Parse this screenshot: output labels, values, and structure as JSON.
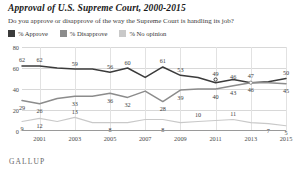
{
  "header": {
    "title": "Approval of U.S. Supreme Court, 2000-2015",
    "subtitle": "Do you approve or disapprove of the way the Supreme Court is handling its job?",
    "brand": "GALLUP"
  },
  "colors": {
    "approve": "#3b3b3b",
    "disapprove": "#8c8c8c",
    "no_opinion": "#c9c9c9",
    "grid": "#d8d8d8",
    "axis": "#9a9a9a",
    "text": "#3d3d3d"
  },
  "chart_data": {
    "type": "line",
    "title": "Approval of U.S. Supreme Court, 2000-2015",
    "subtitle": "Do you approve or disapprove of the way the Supreme Court is handling its job?",
    "xlabel": "",
    "ylabel": "",
    "ylim": [
      0,
      80
    ],
    "yticks": [
      0,
      20,
      40,
      60,
      80
    ],
    "ytick_labels": [
      "0",
      "20",
      "40",
      "60",
      "80"
    ],
    "grid": true,
    "legend_position": "top-left",
    "x": [
      2000,
      2001,
      2002,
      2003,
      2004,
      2005,
      2006,
      2007,
      2008,
      2009,
      2010,
      2011,
      2012,
      2013,
      2014,
      2015
    ],
    "xticks": [
      2001,
      2003,
      2005,
      2007,
      2009,
      2011,
      2013,
      2015
    ],
    "xtick_labels": [
      "2001",
      "2003",
      "2005",
      "2007",
      "2009",
      "2011",
      "2013",
      "2015"
    ],
    "series": [
      {
        "name": "% Approve",
        "color": "#3b3b3b",
        "values": [
          62,
          62,
          60,
          59,
          59,
          56,
          60,
          51,
          61,
          53,
          51,
          46,
          49,
          46,
          47,
          50
        ],
        "labels": [
          {
            "x": 2000,
            "y": 62,
            "text": "62",
            "pos": "above"
          },
          {
            "x": 2001,
            "y": 62,
            "text": "62",
            "pos": "above"
          },
          {
            "x": 2003,
            "y": 59,
            "text": "59",
            "pos": "above"
          },
          {
            "x": 2005,
            "y": 56,
            "text": "56",
            "pos": "above"
          },
          {
            "x": 2006,
            "y": 60,
            "text": "60",
            "pos": "above"
          },
          {
            "x": 2008,
            "y": 61,
            "text": "61",
            "pos": "above"
          },
          {
            "x": 2009,
            "y": 53,
            "text": "53",
            "pos": "above"
          },
          {
            "x": 2011,
            "y": 49,
            "text": "49",
            "pos": "above"
          },
          {
            "x": 2012,
            "y": 46,
            "text": "46",
            "pos": "above"
          },
          {
            "x": 2013,
            "y": 47,
            "text": "47",
            "pos": "above"
          },
          {
            "x": 2015,
            "y": 50,
            "text": "50",
            "pos": "above"
          }
        ]
      },
      {
        "name": "% Disapprove",
        "color": "#8c8c8c",
        "values": [
          29,
          26,
          31,
          33,
          33,
          36,
          32,
          38,
          28,
          39,
          40,
          40,
          43,
          46,
          46,
          45
        ],
        "labels": [
          {
            "x": 2000,
            "y": 29,
            "text": "29",
            "pos": "below"
          },
          {
            "x": 2001,
            "y": 26,
            "text": "26",
            "pos": "below"
          },
          {
            "x": 2003,
            "y": 33,
            "text": "33",
            "pos": "below"
          },
          {
            "x": 2005,
            "y": 36,
            "text": "36",
            "pos": "below"
          },
          {
            "x": 2006,
            "y": 32,
            "text": "32",
            "pos": "below"
          },
          {
            "x": 2008,
            "y": 28,
            "text": "28",
            "pos": "below"
          },
          {
            "x": 2009,
            "y": 39,
            "text": "39",
            "pos": "below"
          },
          {
            "x": 2011,
            "y": 40,
            "text": "40",
            "pos": "below"
          },
          {
            "x": 2012,
            "y": 43,
            "text": "43",
            "pos": "below"
          },
          {
            "x": 2013,
            "y": 46,
            "text": "46",
            "pos": "below"
          },
          {
            "x": 2015,
            "y": 45,
            "text": "45",
            "pos": "below"
          }
        ]
      },
      {
        "name": "% No opinion",
        "color": "#c9c9c9",
        "values": [
          9,
          12,
          9,
          13,
          8,
          8,
          8,
          11,
          11,
          8,
          9,
          10,
          11,
          8,
          7,
          5
        ],
        "labels": [
          {
            "x": 2000,
            "y": 9,
            "text": "9",
            "pos": "below"
          },
          {
            "x": 2001,
            "y": 12,
            "text": "12",
            "pos": "below"
          },
          {
            "x": 2003,
            "y": 13,
            "text": "13",
            "pos": "above"
          },
          {
            "x": 2005,
            "y": 8,
            "text": "8",
            "pos": "below"
          },
          {
            "x": 2008,
            "y": 8,
            "text": "8",
            "pos": "below"
          },
          {
            "x": 2010,
            "y": 10,
            "text": "10",
            "pos": "above"
          },
          {
            "x": 2012,
            "y": 11,
            "text": "11",
            "pos": "above"
          },
          {
            "x": 2014,
            "y": 7,
            "text": "7",
            "pos": "below"
          },
          {
            "x": 2015,
            "y": 5,
            "text": "5",
            "pos": "below"
          }
        ]
      }
    ]
  },
  "legend": {
    "items": [
      {
        "label": "% Approve",
        "color": "#3b3b3b"
      },
      {
        "label": "% Disapprove",
        "color": "#8c8c8c"
      },
      {
        "label": "% No opinion",
        "color": "#c9c9c9"
      }
    ]
  }
}
